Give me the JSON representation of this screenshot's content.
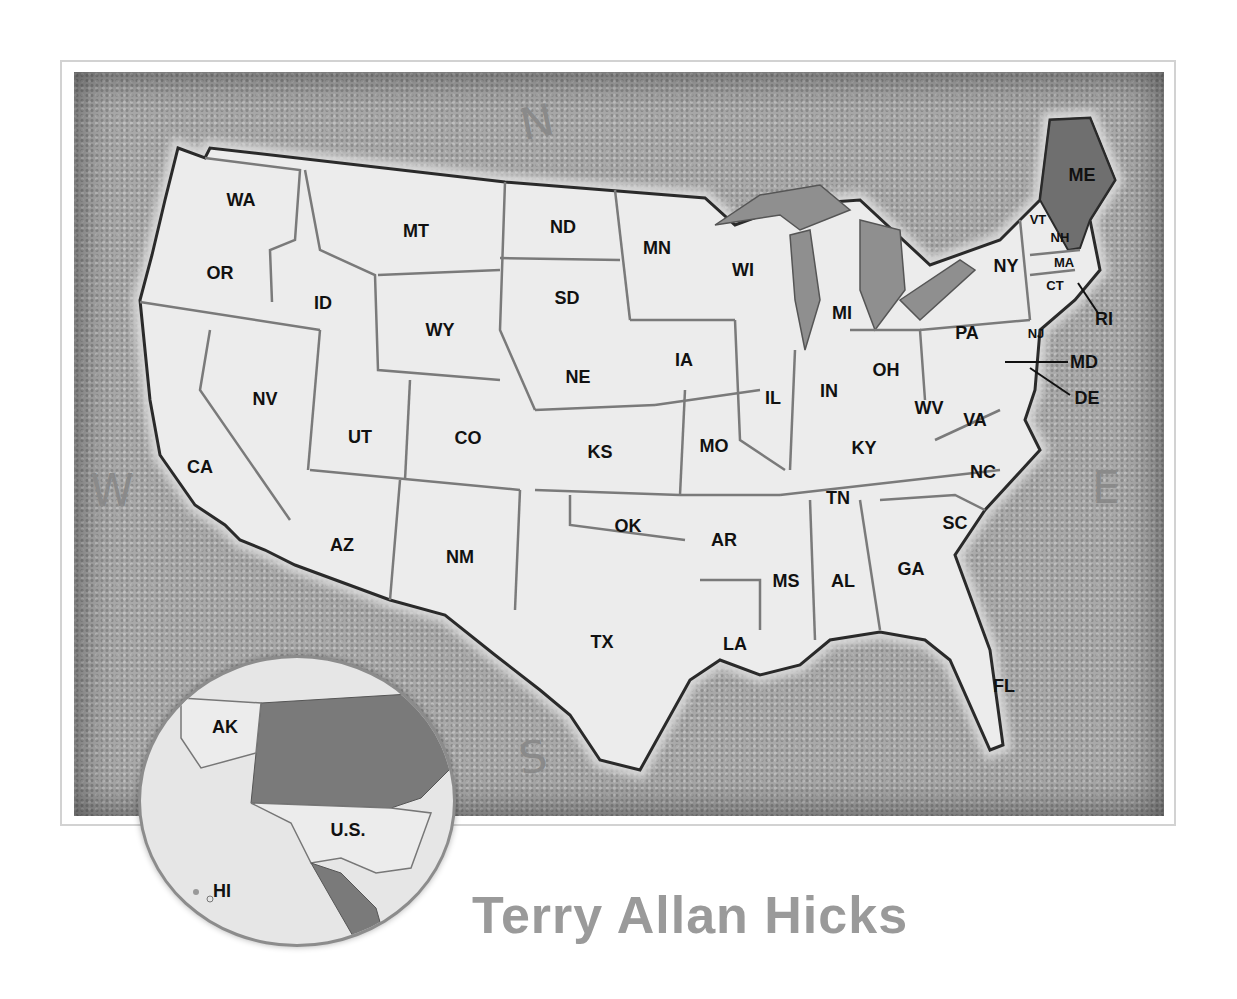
{
  "map": {
    "title": "United States",
    "compass": {
      "north": "N",
      "south": "S",
      "east": "E",
      "west": "W"
    },
    "highlighted_state": "ME",
    "colors": {
      "background": "#a9a9a9",
      "land": "#ececec",
      "highlight": "#6f6f6f",
      "lakes": "#8f8f8f",
      "border": "#2a2a2a"
    },
    "states": [
      {
        "abbr": "WA",
        "x": 241,
        "y": 200
      },
      {
        "abbr": "OR",
        "x": 220,
        "y": 273
      },
      {
        "abbr": "CA",
        "x": 200,
        "y": 467
      },
      {
        "abbr": "NV",
        "x": 265,
        "y": 399
      },
      {
        "abbr": "ID",
        "x": 323,
        "y": 303
      },
      {
        "abbr": "MT",
        "x": 416,
        "y": 231
      },
      {
        "abbr": "WY",
        "x": 440,
        "y": 330
      },
      {
        "abbr": "UT",
        "x": 360,
        "y": 437
      },
      {
        "abbr": "CO",
        "x": 468,
        "y": 438
      },
      {
        "abbr": "AZ",
        "x": 342,
        "y": 545
      },
      {
        "abbr": "NM",
        "x": 460,
        "y": 557
      },
      {
        "abbr": "ND",
        "x": 563,
        "y": 227
      },
      {
        "abbr": "SD",
        "x": 567,
        "y": 298
      },
      {
        "abbr": "NE",
        "x": 578,
        "y": 377
      },
      {
        "abbr": "KS",
        "x": 600,
        "y": 452
      },
      {
        "abbr": "OK",
        "x": 628,
        "y": 526
      },
      {
        "abbr": "TX",
        "x": 602,
        "y": 642
      },
      {
        "abbr": "MN",
        "x": 657,
        "y": 248
      },
      {
        "abbr": "IA",
        "x": 684,
        "y": 360
      },
      {
        "abbr": "MO",
        "x": 714,
        "y": 446
      },
      {
        "abbr": "AR",
        "x": 724,
        "y": 540
      },
      {
        "abbr": "LA",
        "x": 735,
        "y": 644
      },
      {
        "abbr": "WI",
        "x": 743,
        "y": 270
      },
      {
        "abbr": "IL",
        "x": 773,
        "y": 398
      },
      {
        "abbr": "MI",
        "x": 842,
        "y": 313
      },
      {
        "abbr": "IN",
        "x": 829,
        "y": 391
      },
      {
        "abbr": "OH",
        "x": 886,
        "y": 370
      },
      {
        "abbr": "KY",
        "x": 864,
        "y": 448
      },
      {
        "abbr": "TN",
        "x": 838,
        "y": 498
      },
      {
        "abbr": "MS",
        "x": 786,
        "y": 581
      },
      {
        "abbr": "AL",
        "x": 843,
        "y": 581
      },
      {
        "abbr": "GA",
        "x": 911,
        "y": 569
      },
      {
        "abbr": "FL",
        "x": 1004,
        "y": 686
      },
      {
        "abbr": "SC",
        "x": 955,
        "y": 523
      },
      {
        "abbr": "NC",
        "x": 983,
        "y": 472
      },
      {
        "abbr": "VA",
        "x": 975,
        "y": 420
      },
      {
        "abbr": "WV",
        "x": 929,
        "y": 408
      },
      {
        "abbr": "PA",
        "x": 967,
        "y": 333
      },
      {
        "abbr": "NY",
        "x": 1006,
        "y": 266
      },
      {
        "abbr": "ME",
        "x": 1082,
        "y": 175
      },
      {
        "abbr": "VT",
        "x": 1038,
        "y": 219
      },
      {
        "abbr": "NH",
        "x": 1060,
        "y": 237
      },
      {
        "abbr": "MA",
        "x": 1064,
        "y": 262
      },
      {
        "abbr": "CT",
        "x": 1055,
        "y": 285
      },
      {
        "abbr": "RI",
        "x": 1104,
        "y": 319
      },
      {
        "abbr": "NJ",
        "x": 1036,
        "y": 333
      },
      {
        "abbr": "MD",
        "x": 1084,
        "y": 362
      },
      {
        "abbr": "DE",
        "x": 1087,
        "y": 398
      }
    ]
  },
  "inset": {
    "labels": [
      {
        "text": "AK",
        "x": 225,
        "y": 727
      },
      {
        "text": "U.S.",
        "x": 348,
        "y": 830
      },
      {
        "text": "HI",
        "x": 222,
        "y": 891
      }
    ]
  },
  "author": "Terry Allan Hicks"
}
